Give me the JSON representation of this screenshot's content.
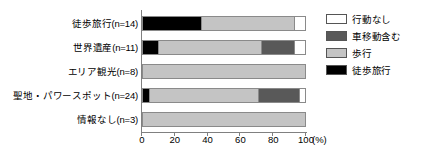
{
  "chart_data": {
    "type": "bar",
    "orientation": "horizontal",
    "stacked": true,
    "normalized": true,
    "title": "",
    "xlabel": "(%)",
    "ylabel": "",
    "xlim": [
      0,
      100
    ],
    "xticks": [
      0,
      20,
      40,
      60,
      80,
      100
    ],
    "xtick_labels": [
      "0",
      "20",
      "40",
      "60",
      "80",
      "100"
    ],
    "grid": false,
    "legend_position": "right",
    "categories": [
      "徒歩旅行(n=14)",
      "世界遺産(n=11)",
      "エリア観光(n=8)",
      "聖地・パワースポット(n=24)",
      "情報なし(n=3)"
    ],
    "series": [
      {
        "name": "徒歩旅行",
        "color": "#000000",
        "values": [
          36,
          9,
          0,
          4,
          0
        ]
      },
      {
        "name": "歩行",
        "color": "#c4c4c4",
        "values": [
          57,
          64,
          100,
          67,
          100
        ]
      },
      {
        "name": "車移動含む",
        "color": "#595959",
        "values": [
          0,
          20,
          0,
          25,
          0
        ]
      },
      {
        "name": "行動なし",
        "color": "#ffffff",
        "values": [
          7,
          7,
          0,
          4,
          0
        ]
      }
    ],
    "legend_entries": [
      {
        "label": "行動なし",
        "color": "#ffffff"
      },
      {
        "label": "車移動含む",
        "color": "#595959"
      },
      {
        "label": "歩行",
        "color": "#c4c4c4"
      },
      {
        "label": "徒歩旅行",
        "color": "#000000"
      }
    ]
  }
}
